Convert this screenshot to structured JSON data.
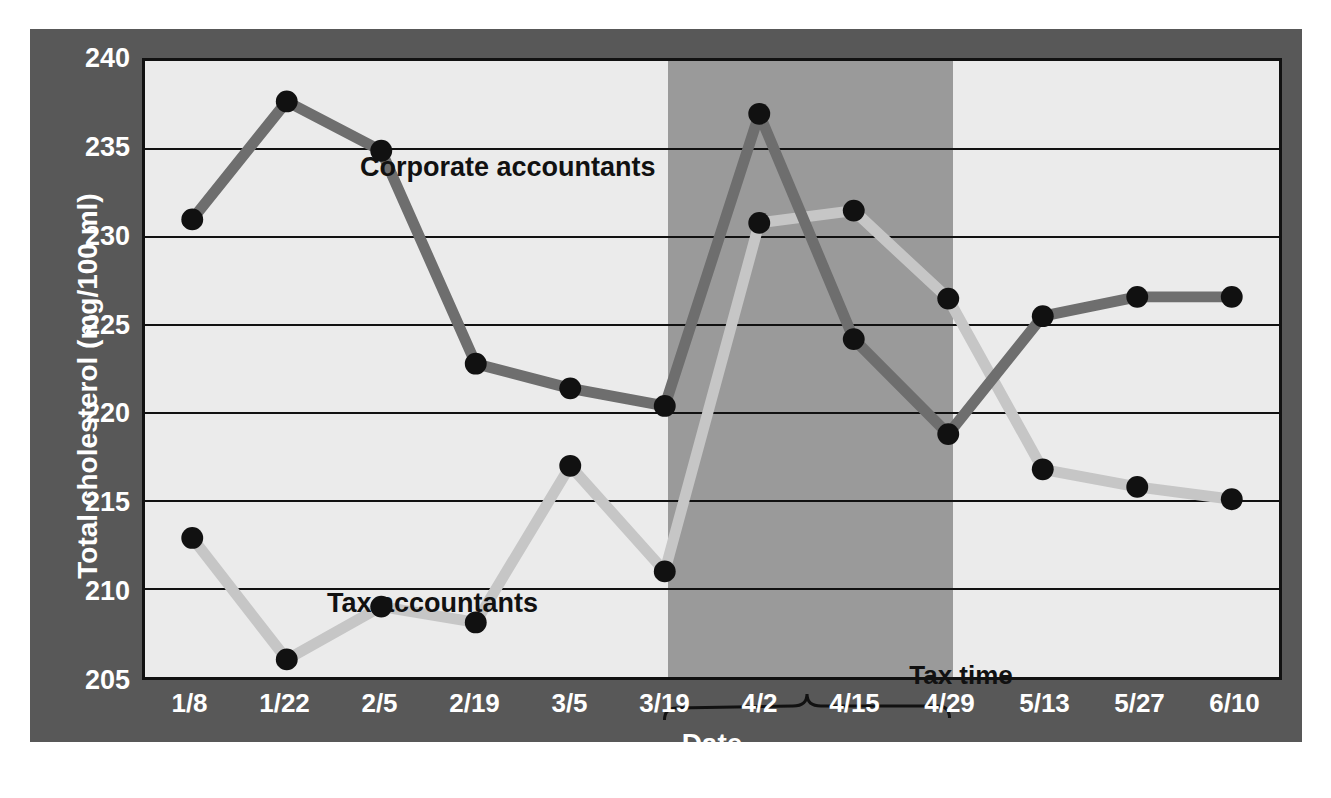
{
  "chart_data": {
    "type": "line",
    "title": "",
    "xlabel": "Date",
    "ylabel": "Total cholesterol (mg/100 ml)",
    "categories": [
      "1/8",
      "1/22",
      "2/5",
      "2/19",
      "3/5",
      "3/19",
      "4/2",
      "4/15",
      "4/29",
      "5/13",
      "5/27",
      "6/10"
    ],
    "xticklabels": [
      "1/8",
      "1/22",
      "2/5",
      "2/19",
      "3/5",
      "3/19",
      "4/2",
      "4/15",
      "4/29",
      "5/13",
      "5/27",
      "6/10"
    ],
    "yticklabels": [
      "240",
      "235",
      "230",
      "225",
      "220",
      "215",
      "210",
      "205"
    ],
    "yticks": [
      240,
      235,
      230,
      225,
      220,
      215,
      210,
      205
    ],
    "ylim": [
      205,
      240
    ],
    "grid": "horizontal",
    "legend": "inline-labels",
    "series": [
      {
        "name": "Corporate accountants",
        "color": "#6e6e6e",
        "marker_color": "#111111",
        "values": [
          231.0,
          237.7,
          234.9,
          222.8,
          221.4,
          220.4,
          237.0,
          224.2,
          218.8,
          225.5,
          226.6,
          226.6
        ]
      },
      {
        "name": "Tax accountants",
        "color": "#c6c6c6",
        "marker_color": "#111111",
        "values": [
          212.9,
          206.0,
          209.0,
          208.1,
          217.0,
          211.0,
          230.8,
          231.5,
          226.5,
          216.8,
          215.8,
          215.1
        ]
      }
    ],
    "annotations": [
      {
        "name": "tax-time",
        "label": "Tax time",
        "span": [
          "3/19",
          "4/29"
        ],
        "style": "shaded-band-with-brace"
      }
    ],
    "shaded_band": {
      "label": "Tax time",
      "from": "3/19",
      "to": "4/29",
      "color": "#9a9a9a"
    },
    "colors": {
      "plate": "#585858",
      "plot_background": "#ebebeb",
      "band": "#9a9a9a",
      "gridline": "#111111",
      "axis_text": "#ffffff",
      "corporate_line": "#6e6e6e",
      "tax_line": "#c6c6c6",
      "marker": "#111111"
    }
  }
}
